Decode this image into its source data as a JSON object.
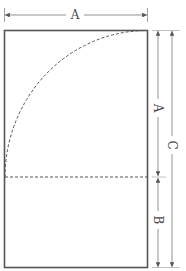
{
  "diagram": {
    "type": "geometric-construction",
    "colors": {
      "background": "#ffffff",
      "outline": "#555555",
      "dashed": "#555555",
      "dimension": "#777777",
      "label": "#4a4a4a"
    },
    "labels": {
      "top_width": "A",
      "square_height": "A",
      "strip_height": "B",
      "total_height": "C"
    },
    "shapes": {
      "rectangle": {
        "x": 4,
        "y": 30,
        "width": 143,
        "height": 237
      },
      "square_divider_y": 177,
      "arc": {
        "center_x": 147,
        "center_y": 177,
        "radius": 143,
        "style": "dashed"
      }
    },
    "dimensions": [
      {
        "id": "width-A",
        "orientation": "horizontal",
        "from": 4,
        "to": 147,
        "at": 15,
        "label": "A"
      },
      {
        "id": "height-A",
        "orientation": "vertical",
        "from": 30,
        "to": 177,
        "at": 158,
        "label": "A"
      },
      {
        "id": "height-B",
        "orientation": "vertical",
        "from": 177,
        "to": 267,
        "at": 158,
        "label": "B"
      },
      {
        "id": "height-C",
        "orientation": "vertical",
        "from": 30,
        "to": 267,
        "at": 172,
        "label": "C"
      }
    ]
  }
}
